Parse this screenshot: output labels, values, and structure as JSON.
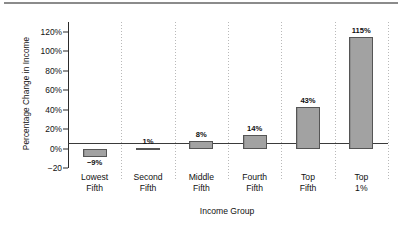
{
  "chart_data": {
    "type": "bar",
    "title": "",
    "xlabel": "Income Group",
    "ylabel": "Percentage Change in Income",
    "categories": [
      "Lowest Fifth",
      "Second Fifth",
      "Middle Fifth",
      "Fourth Fifth",
      "Top Fifth",
      "Top 1%"
    ],
    "category_lines": [
      [
        "Lowest",
        "Fifth"
      ],
      [
        "Second",
        "Fifth"
      ],
      [
        "Middle",
        "Fifth"
      ],
      [
        "Fourth",
        "Fifth"
      ],
      [
        "Top",
        "Fifth"
      ],
      [
        "Top",
        "1%"
      ]
    ],
    "values": [
      -9,
      1,
      8,
      14,
      43,
      115
    ],
    "data_labels": [
      "−9%",
      "1%",
      "8%",
      "14%",
      "43%",
      "115%"
    ],
    "ylim": [
      -20,
      130
    ],
    "yticks": [
      120,
      100,
      80,
      60,
      40,
      20,
      0,
      -20
    ],
    "ytick_labels": [
      "120%",
      "100%",
      "80%",
      "60%",
      "40%",
      "20%",
      "0%",
      "−20"
    ],
    "grid": "vertical-dotted-category-separators",
    "legend": "none",
    "bar_color": "#9b9b9b",
    "bar_edge_color": "#555555",
    "axis_color": "#2b2b2b",
    "background_color": "#ffffff",
    "top_rule_color": "#8b8b8b"
  }
}
